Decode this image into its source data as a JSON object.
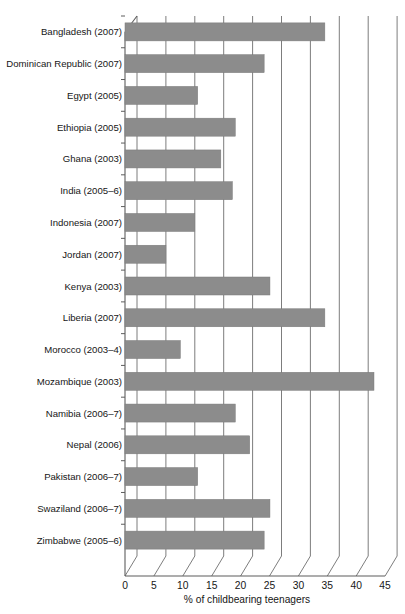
{
  "chart_data": {
    "type": "bar",
    "orientation": "horizontal",
    "title": "",
    "xlabel": "% of childbearing teenagers",
    "ylabel": "",
    "xlim": [
      0,
      45
    ],
    "xticks": [
      0,
      5,
      10,
      15,
      20,
      25,
      30,
      35,
      40,
      45
    ],
    "grid": true,
    "legend": null,
    "bar_color": "#8c8c8c",
    "categories": [
      "Bangladesh (2007)",
      "Dominican Republic (2007)",
      "Egypt (2005)",
      "Ethiopia (2005)",
      "Ghana (2003)",
      "India (2005–6)",
      "Indonesia (2007)",
      "Jordan (2007)",
      "Kenya (2003)",
      "Liberia (2007)",
      "Morocco (2003–4)",
      "Mozambique (2003)",
      "Namibia (2006–7)",
      "Nepal (2006)",
      "Pakistan (2006–7)",
      "Swaziland (2006–7)",
      "Zimbabwe (2005–6)"
    ],
    "values": [
      32.5,
      22,
      10.5,
      17,
      14.5,
      16.5,
      10,
      5,
      23,
      32.5,
      7.5,
      41,
      17,
      19.5,
      10.5,
      23,
      22
    ]
  },
  "axis": {
    "tick_labels": [
      "0",
      "5",
      "10",
      "15",
      "20",
      "25",
      "30",
      "35",
      "40",
      "45"
    ],
    "x_axis_title": "% of childbearing teenagers"
  }
}
